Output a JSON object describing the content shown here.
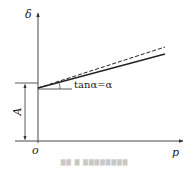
{
  "diagram": {
    "axes": {
      "y_label": "δ",
      "x_label": "p",
      "origin_label": "o"
    },
    "dimension": {
      "label": "A"
    },
    "annotation": {
      "slope_label": "tanα=α"
    },
    "lines": [
      {
        "name": "solid-line",
        "style": "solid",
        "color": "#222222"
      },
      {
        "name": "dashed-line",
        "style": "dashed",
        "color": "#222222"
      }
    ],
    "caption": "▇▇ ▇ ▇▇▇▇▇▇▇▇"
  }
}
